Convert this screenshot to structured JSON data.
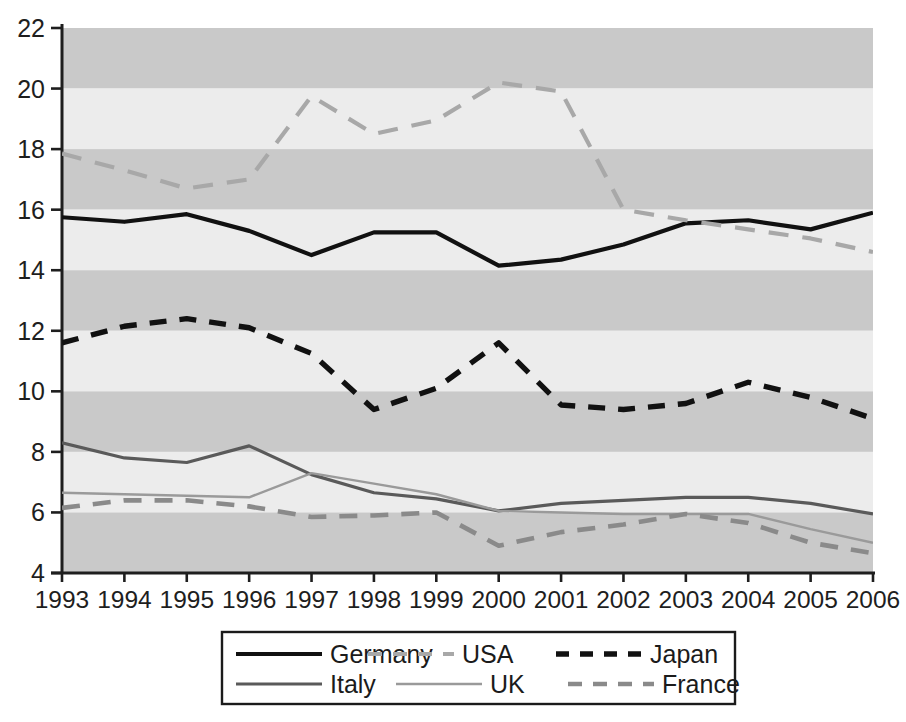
{
  "chart_data": {
    "type": "line",
    "title": "",
    "subtitle": "",
    "xlabel": "",
    "ylabel": "",
    "x": [
      1993,
      1994,
      1995,
      1996,
      1997,
      1998,
      1999,
      2000,
      2001,
      2002,
      2003,
      2004,
      2005,
      2006
    ],
    "xtick_labels": [
      "1993",
      "1994",
      "1995",
      "1996",
      "1997",
      "1998",
      "1999",
      "2000",
      "2001",
      "2002",
      "2003",
      "2004",
      "2005",
      "2006"
    ],
    "ytick_labels": [
      "4",
      "6",
      "8",
      "10",
      "12",
      "14",
      "16",
      "18",
      "20",
      "22"
    ],
    "ytick_values": [
      4,
      6,
      8,
      10,
      12,
      14,
      16,
      18,
      20,
      22
    ],
    "ylim": [
      4,
      22
    ],
    "xlim": [
      1993,
      2006
    ],
    "grid": false,
    "banded_background": true,
    "band_step": 2,
    "band_colors": [
      "#c9c9c9",
      "#ececec"
    ],
    "legend_position": "bottom-center",
    "series": [
      {
        "name": "Germany",
        "color": "#111111",
        "style": "solid",
        "width": 4.2,
        "values": [
          15.75,
          15.6,
          15.85,
          15.3,
          14.5,
          15.25,
          15.25,
          14.15,
          14.35,
          14.85,
          15.55,
          15.65,
          15.35,
          15.9
        ]
      },
      {
        "name": "USA",
        "color": "#a8a8a8",
        "style": "dashed",
        "width": 4.2,
        "values": [
          17.85,
          17.3,
          16.7,
          17.0,
          19.75,
          18.5,
          18.95,
          20.2,
          19.9,
          16.0,
          15.65,
          15.35,
          15.05,
          14.6
        ]
      },
      {
        "name": "Japan",
        "color": "#111111",
        "style": "dashed",
        "width": 5.4,
        "values": [
          11.6,
          12.15,
          12.4,
          12.1,
          11.25,
          9.4,
          10.1,
          11.6,
          9.55,
          9.4,
          9.6,
          10.3,
          9.8,
          9.1
        ]
      },
      {
        "name": "Italy",
        "color": "#5a5a5a",
        "style": "solid",
        "width": 3.2,
        "values": [
          8.3,
          7.8,
          7.65,
          8.2,
          7.25,
          6.65,
          6.45,
          6.05,
          6.3,
          6.4,
          6.5,
          6.5,
          6.3,
          5.95
        ]
      },
      {
        "name": "UK",
        "color": "#9a9a9a",
        "style": "solid",
        "width": 2.4,
        "values": [
          6.65,
          6.6,
          6.55,
          6.5,
          7.3,
          6.95,
          6.6,
          6.05,
          6.0,
          5.95,
          5.95,
          5.95,
          5.45,
          5.0
        ]
      },
      {
        "name": "France",
        "color": "#8a8a8a",
        "style": "dashed",
        "width": 4.6,
        "values": [
          6.15,
          6.4,
          6.4,
          6.2,
          5.85,
          5.9,
          6.0,
          4.9,
          5.35,
          5.6,
          5.95,
          5.65,
          5.0,
          4.65
        ]
      }
    ]
  },
  "legend": {
    "entries": [
      {
        "label": "Germany",
        "series": "Germany"
      },
      {
        "label": "USA",
        "series": "USA"
      },
      {
        "label": "Japan",
        "series": "Japan"
      },
      {
        "label": "Italy",
        "series": "Italy"
      },
      {
        "label": "UK",
        "series": "UK"
      },
      {
        "label": "France",
        "series": "France"
      }
    ]
  },
  "axes": {
    "y_axis_color": "#1e1e1e",
    "x_axis_color": "#1e1e1e"
  }
}
